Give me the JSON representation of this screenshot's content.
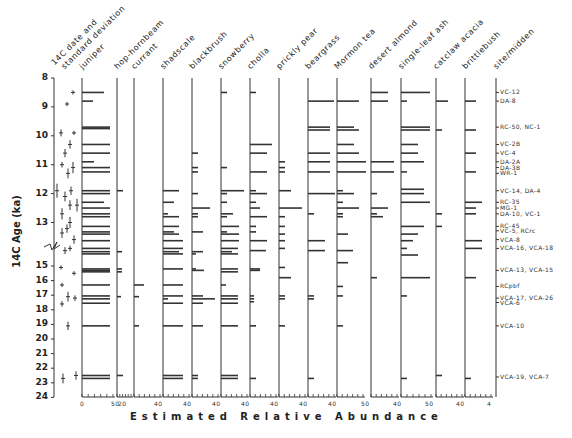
{
  "chart_data": {
    "type": "bar",
    "title": "",
    "xlabel": "Estimated Relative Abundance",
    "ylabel": "14C Age (ka)",
    "y_ticks": [
      8,
      9,
      10,
      11,
      12,
      13,
      15,
      16,
      17,
      18,
      19,
      20,
      21,
      22,
      23,
      24
    ],
    "y_axis_break": "between 13 and 15 ka",
    "ylim": [
      8,
      24
    ],
    "grid": false,
    "legend": "none",
    "columns": [
      {
        "name": "14C date and standard deviation",
        "type": "error-bar"
      },
      {
        "name": "juniper",
        "scale_max": 50,
        "tick_label": "0 50"
      },
      {
        "name": "hop-hornbeam",
        "scale_max": 20,
        "tick_label": "20"
      },
      {
        "name": "currant",
        "scale_max": 40,
        "tick_label": "40"
      },
      {
        "name": "shadscale",
        "scale_max": 40,
        "tick_label": "40"
      },
      {
        "name": "blackbrush",
        "scale_max": 40,
        "tick_label": "40"
      },
      {
        "name": "snowberry",
        "scale_max": 40,
        "tick_label": "40"
      },
      {
        "name": "cholla",
        "scale_max": 40,
        "tick_label": "40"
      },
      {
        "name": "prickly pear",
        "scale_max": 40,
        "tick_label": "40"
      },
      {
        "name": "beargrass",
        "scale_max": 40,
        "tick_label": "40"
      },
      {
        "name": "Mormon tea",
        "scale_max": 40,
        "tick_label": "40"
      },
      {
        "name": "desert almond",
        "scale_max": 50,
        "tick_label": "50"
      },
      {
        "name": "single-leaf ash",
        "scale_max": 40,
        "tick_label": "40"
      },
      {
        "name": "catclaw acacia",
        "scale_max": 50,
        "tick_label": "50"
      },
      {
        "name": "brittlebush",
        "scale_max": 40,
        "tick_label": "40"
      },
      {
        "name": "site/midden",
        "type": "labels"
      }
    ],
    "sites": [
      {
        "label": "VC-12",
        "age": 8.5
      },
      {
        "label": "DA-8",
        "age": 8.8
      },
      {
        "label": "RC-50, NC-1",
        "age": 9.7
      },
      {
        "label": "VC-2B",
        "age": 10.3
      },
      {
        "label": "VC-4",
        "age": 10.6
      },
      {
        "label": "DA-2A",
        "age": 10.9
      },
      {
        "label": "DA-3B",
        "age": 11.1
      },
      {
        "label": "WR-1",
        "age": 11.3
      },
      {
        "label": "VC-14, DA-4",
        "age": 11.9
      },
      {
        "label": "RC-35",
        "age": 12.3
      },
      {
        "label": "MG-1",
        "age": 12.5
      },
      {
        "label": "DA-10, VC-1",
        "age": 12.7
      },
      {
        "label": "RC-45",
        "age": 13.2
      },
      {
        "label": "VC-5, RCrc",
        "age": 13.4
      },
      {
        "label": "VCA-8",
        "age": 13.8
      },
      {
        "label": "VCA-16, VCA-18",
        "age": 14.2
      },
      {
        "label": "VCA-13, VCA-15",
        "age": 15.3
      },
      {
        "label": "RCpbf",
        "age": 16.4
      },
      {
        "label": "VCA-17, VCA-26",
        "age": 17.2
      },
      {
        "label": "VCA-6",
        "age": 17.5
      },
      {
        "label": "VCA-10",
        "age": 19.1
      },
      {
        "label": "VCA-19, VCA-7",
        "age": 22.6
      }
    ]
  },
  "headers": [
    "14C date and",
    "standard deviation",
    "juniper",
    "hop-hornbeam",
    "currant",
    "shadscale",
    "blackbrush",
    "snowberry",
    "cholla",
    "prickly pear",
    "beargrass",
    "Mormon tea",
    "desert almond",
    "single-leaf ash",
    "catclaw acacia",
    "brittlebush",
    "site/midden"
  ],
  "y_labels": [
    "8",
    "9",
    "10",
    "11",
    "12",
    "13",
    "15",
    "16",
    "17",
    "18",
    "19",
    "20",
    "21",
    "22",
    "23",
    "24"
  ],
  "x_ticks": [
    "0",
    "50",
    "20",
    "40",
    "40",
    "40",
    "40",
    "40",
    "40",
    "40",
    "50",
    "40",
    "50",
    "40",
    "4"
  ],
  "xlabel": "Estimated   Relative   Abundance",
  "ylabel": "14C Age (ka)",
  "site_labels": [
    "VC-12",
    "DA-8",
    "RC-50, NC-1",
    "VC-2B",
    "VC-4",
    "DA-2A",
    "DA-3B",
    "WR-1",
    "VC-14, DA-4",
    "RC-35",
    "MG-1",
    "DA-10, VC-1",
    "RC-45",
    "VC-5, RCrc",
    "VCA-8",
    "VCA-16, VCA-18",
    "VCA-13, VCA-15",
    "RCpbf",
    "VCA-17, VCA-26",
    "VCA-6",
    "VCA-10",
    "VCA-19, VCA-7"
  ]
}
